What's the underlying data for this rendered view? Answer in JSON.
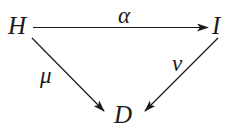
{
  "diagram": {
    "type": "commutative-triangle",
    "nodes": [
      {
        "id": "H",
        "label": "H"
      },
      {
        "id": "I",
        "label": "I"
      },
      {
        "id": "D",
        "label": "D"
      }
    ],
    "edges": [
      {
        "from": "H",
        "to": "I",
        "label": "α"
      },
      {
        "from": "H",
        "to": "D",
        "label": "μ"
      },
      {
        "from": "I",
        "to": "D",
        "label": "ν"
      }
    ],
    "colors": {
      "stroke": "#1a1a1a",
      "background": "#ffffff"
    }
  }
}
